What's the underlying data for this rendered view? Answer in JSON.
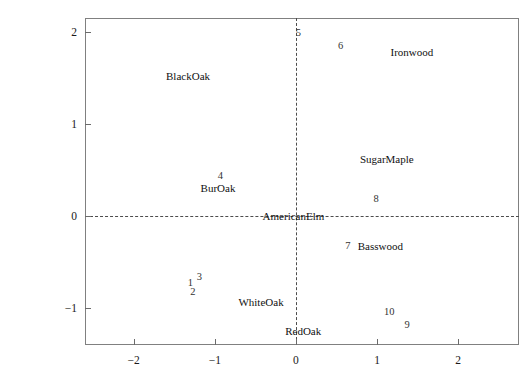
{
  "chart_data": {
    "type": "scatter",
    "title": "",
    "xlabel": "",
    "ylabel": "",
    "xlim": [
      -2.6,
      2.75
    ],
    "ylim": [
      -1.4,
      2.15
    ],
    "grid": false,
    "legend": "none",
    "xticks": [
      -2,
      -1,
      0,
      1,
      2
    ],
    "xticklabels": [
      "−2",
      "−1",
      "0",
      "1",
      "2"
    ],
    "yticks": [
      -1,
      0,
      1,
      2
    ],
    "yticklabels": [
      "−1",
      "0",
      "1",
      "2"
    ],
    "reference_lines": [
      {
        "axis": "y",
        "value": 0,
        "style": "dashed"
      },
      {
        "axis": "x",
        "value": 0,
        "style": "dashed"
      }
    ],
    "observations": {
      "name": "Observations",
      "labels": [
        "1",
        "2",
        "3",
        "4",
        "5",
        "6",
        "7",
        "8",
        "9",
        "10"
      ],
      "x": [
        -1.3,
        -1.27,
        -1.19,
        -0.93,
        0.03,
        0.55,
        0.64,
        0.99,
        1.37,
        1.15
      ],
      "y": [
        -0.73,
        -0.82,
        -0.66,
        0.44,
        1.99,
        1.85,
        -0.32,
        0.18,
        -1.18,
        -1.04
      ]
    },
    "variables": {
      "name": "Variables",
      "labels": [
        "BlackOak",
        "BurOak",
        "WhiteOak",
        "RedOak",
        "AmericanElm",
        "Basswood",
        "SugarMaple",
        "Ironwood"
      ],
      "x": [
        -1.33,
        -0.96,
        -0.43,
        0.09,
        -0.03,
        1.04,
        1.12,
        1.43
      ],
      "y": [
        1.52,
        0.3,
        -0.93,
        -1.25,
        0.0,
        -0.32,
        0.62,
        1.78
      ]
    }
  },
  "figure": {
    "background_color": "#ffffff",
    "frame_color": "#808080",
    "text_color": "#1a1a1a",
    "reference_line_color": "#4d4d4d"
  }
}
